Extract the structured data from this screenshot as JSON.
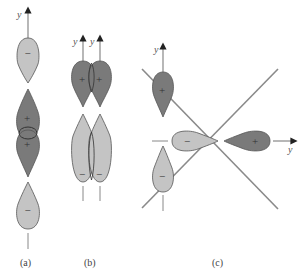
{
  "figure": {
    "colors": {
      "positive_lobe": "#7a7a7a",
      "negative_lobe": "#c4c4c4",
      "outline": "#555555",
      "axis": "#888888",
      "diagonal": "#8a8a8a",
      "background": "#ffffff"
    },
    "panels": [
      {
        "id": "a",
        "label": "(a)",
        "axis_label": "y",
        "lobes": [
          {
            "sign": "−",
            "shade": "negative"
          },
          {
            "sign": "+",
            "shade": "positive"
          },
          {
            "sign": "+",
            "shade": "positive"
          },
          {
            "sign": "−",
            "shade": "negative"
          }
        ]
      },
      {
        "id": "b",
        "label": "(b)",
        "axis_labels": [
          "y",
          "y"
        ],
        "lobes": [
          {
            "sign": "+",
            "shade": "positive"
          },
          {
            "sign": "+",
            "shade": "positive"
          },
          {
            "sign": "−",
            "shade": "negative"
          },
          {
            "sign": "−",
            "shade": "negative"
          }
        ]
      },
      {
        "id": "c",
        "label": "(c)",
        "axis_label_vertical": "y",
        "axis_label_horizontal": "y",
        "lobes": [
          {
            "sign": "+",
            "shade": "positive",
            "orientation": "vertical-up"
          },
          {
            "sign": "−",
            "shade": "negative",
            "orientation": "vertical-down"
          },
          {
            "sign": "−",
            "shade": "negative",
            "orientation": "horizontal-left"
          },
          {
            "sign": "+",
            "shade": "positive",
            "orientation": "horizontal-right"
          }
        ]
      }
    ]
  }
}
